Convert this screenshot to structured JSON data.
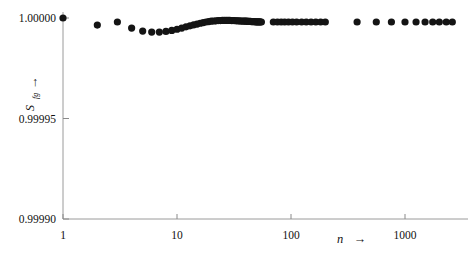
{
  "figure": {
    "background": "#ffffff",
    "ink_color": "#111111",
    "axis_color": "#8a8a8a",
    "marker_color": "#141414"
  },
  "chart_data": {
    "type": "scatter",
    "title": "",
    "subtitle": "",
    "xlabel": "n →",
    "xlabel_symbol": "n",
    "xlabel_arrow": "→",
    "ylabel": "S_fg ↑",
    "ylabel_symbol": "S",
    "ylabel_subscript": "fg",
    "ylabel_arrow": "↑",
    "xscale": "log",
    "yscale": "linear",
    "xlim": [
      1,
      3000
    ],
    "ylim": [
      0.9999,
      1.0
    ],
    "grid": false,
    "legend": null,
    "xticks": [
      1,
      10,
      100,
      1000
    ],
    "xtick_labels": [
      "1",
      "10",
      "100",
      "1000"
    ],
    "yticks": [
      0.9999,
      0.99995,
      1.0
    ],
    "ytick_labels": [
      "0.99990",
      "0.99995",
      "1.00000"
    ],
    "marker": "circle",
    "marker_size": 3.6,
    "points": [
      {
        "n": 1,
        "s": 1.0
      },
      {
        "n": 2,
        "s": 0.9999965
      },
      {
        "n": 3,
        "s": 0.999998
      },
      {
        "n": 4,
        "s": 0.999995
      },
      {
        "n": 5,
        "s": 0.9999935
      },
      {
        "n": 6,
        "s": 0.999993
      },
      {
        "n": 7,
        "s": 0.999993
      },
      {
        "n": 8,
        "s": 0.9999933
      },
      {
        "n": 9,
        "s": 0.9999938
      },
      {
        "n": 10,
        "s": 0.9999944
      },
      {
        "n": 11,
        "s": 0.999995
      },
      {
        "n": 12,
        "s": 0.9999956
      },
      {
        "n": 13,
        "s": 0.9999961
      },
      {
        "n": 14,
        "s": 0.9999966
      },
      {
        "n": 15,
        "s": 0.999997
      },
      {
        "n": 16,
        "s": 0.9999974
      },
      {
        "n": 17,
        "s": 0.9999977
      },
      {
        "n": 18,
        "s": 0.999998
      },
      {
        "n": 19,
        "s": 0.9999982
      },
      {
        "n": 20,
        "s": 0.9999984
      },
      {
        "n": 21,
        "s": 0.9999985
      },
      {
        "n": 22,
        "s": 0.9999986
      },
      {
        "n": 23,
        "s": 0.9999987
      },
      {
        "n": 24,
        "s": 0.9999987
      },
      {
        "n": 25,
        "s": 0.9999988
      },
      {
        "n": 26,
        "s": 0.9999988
      },
      {
        "n": 27,
        "s": 0.9999988
      },
      {
        "n": 28,
        "s": 0.9999988
      },
      {
        "n": 29,
        "s": 0.9999988
      },
      {
        "n": 30,
        "s": 0.9999987
      },
      {
        "n": 31,
        "s": 0.9999987
      },
      {
        "n": 32,
        "s": 0.9999987
      },
      {
        "n": 33,
        "s": 0.9999986
      },
      {
        "n": 34,
        "s": 0.9999986
      },
      {
        "n": 35,
        "s": 0.9999986
      },
      {
        "n": 36,
        "s": 0.9999985
      },
      {
        "n": 37,
        "s": 0.9999985
      },
      {
        "n": 38,
        "s": 0.9999985
      },
      {
        "n": 39,
        "s": 0.9999984
      },
      {
        "n": 40,
        "s": 0.9999984
      },
      {
        "n": 41,
        "s": 0.9999984
      },
      {
        "n": 42,
        "s": 0.9999983
      },
      {
        "n": 43,
        "s": 0.9999983
      },
      {
        "n": 44,
        "s": 0.9999983
      },
      {
        "n": 45,
        "s": 0.9999982
      },
      {
        "n": 46,
        "s": 0.9999982
      },
      {
        "n": 47,
        "s": 0.9999982
      },
      {
        "n": 48,
        "s": 0.9999982
      },
      {
        "n": 49,
        "s": 0.9999981
      },
      {
        "n": 50,
        "s": 0.9999981
      },
      {
        "n": 51,
        "s": 0.9999981
      },
      {
        "n": 52,
        "s": 0.9999981
      },
      {
        "n": 53,
        "s": 0.9999981
      },
      {
        "n": 54,
        "s": 0.999998
      },
      {
        "n": 55,
        "s": 0.999998
      },
      {
        "n": 70,
        "s": 0.999998
      },
      {
        "n": 76,
        "s": 0.999998
      },
      {
        "n": 82,
        "s": 0.999998
      },
      {
        "n": 88,
        "s": 0.999998
      },
      {
        "n": 95,
        "s": 0.999998
      },
      {
        "n": 103,
        "s": 0.999998
      },
      {
        "n": 112,
        "s": 0.999998
      },
      {
        "n": 124,
        "s": 0.999998
      },
      {
        "n": 136,
        "s": 0.999998
      },
      {
        "n": 150,
        "s": 0.999998
      },
      {
        "n": 165,
        "s": 0.999998
      },
      {
        "n": 182,
        "s": 0.999998
      },
      {
        "n": 200,
        "s": 0.999998
      },
      {
        "n": 380,
        "s": 0.999998
      },
      {
        "n": 560,
        "s": 0.999998
      },
      {
        "n": 760,
        "s": 0.999998
      },
      {
        "n": 1000,
        "s": 0.999998
      },
      {
        "n": 1250,
        "s": 0.999998
      },
      {
        "n": 1500,
        "s": 0.999998
      },
      {
        "n": 1750,
        "s": 0.999998
      },
      {
        "n": 2000,
        "s": 0.999998
      },
      {
        "n": 2300,
        "s": 0.999998
      },
      {
        "n": 2600,
        "s": 0.999998
      }
    ]
  }
}
